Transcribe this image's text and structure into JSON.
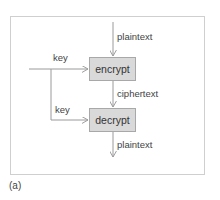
{
  "diagram": {
    "caption": "(a)",
    "nodes": [
      {
        "id": "encrypt",
        "label": "encrypt"
      },
      {
        "id": "decrypt",
        "label": "decrypt"
      }
    ],
    "edges": [
      {
        "from": "input",
        "to": "encrypt",
        "label": "plaintext"
      },
      {
        "from": "key-source",
        "to": "encrypt",
        "label": "key"
      },
      {
        "from": "key-source",
        "to": "decrypt",
        "label": "key"
      },
      {
        "from": "encrypt",
        "to": "decrypt",
        "label": "ciphertext"
      },
      {
        "from": "decrypt",
        "to": "output",
        "label": "plaintext"
      }
    ],
    "colors": {
      "box_fill": "#d9d9d9",
      "box_border": "#a8a8a8",
      "line": "#9a9a9a",
      "frame": "#cfcfcf",
      "text": "#333333"
    }
  }
}
